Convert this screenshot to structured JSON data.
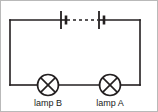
{
  "image": {
    "title": "series circuit with two cells and two lamps",
    "width": 158,
    "height": 112,
    "background_color": "#ffffff",
    "line_color": "#231f20",
    "border_color": "#b9b9b9"
  },
  "diagram": {
    "type": "electrical-circuit-schematic",
    "loop": {
      "shape": "rectangle",
      "left_x": 10,
      "right_x": 140,
      "top_y": 20,
      "bottom_y": 85,
      "stroke_width": 1.6
    },
    "components": [
      {
        "id": "cell-left",
        "name": "battery-cell",
        "symbol": "cell",
        "position_x": 63,
        "position_y": 20,
        "long_plate_x": 61,
        "short_plate_x": 66,
        "long_plate_half_height": 9,
        "short_plate_half_height": 4.5
      },
      {
        "id": "cell-right",
        "name": "battery-cell",
        "symbol": "cell",
        "position_x": 101,
        "position_y": 20,
        "long_plate_x": 99,
        "short_plate_x": 104,
        "long_plate_half_height": 9,
        "short_plate_half_height": 4.5
      },
      {
        "id": "lamp-b",
        "name": "lamp",
        "symbol": "circle-with-cross",
        "label": "lamp B",
        "center_x": 48,
        "center_y": 85,
        "radius": 10.5
      },
      {
        "id": "lamp-a",
        "name": "lamp",
        "symbol": "circle-with-cross",
        "label": "lamp A",
        "center_x": 110,
        "center_y": 85,
        "radius": 10.5
      }
    ],
    "connector": {
      "id": "cells-dashed-link",
      "name": "dashed-connection",
      "style": "dashed",
      "from_x": 66,
      "to_x": 99,
      "y": 20,
      "dash_pattern": "3 3"
    },
    "labels": {
      "lamp_b": "lamp B",
      "lamp_a": "lamp A"
    }
  }
}
